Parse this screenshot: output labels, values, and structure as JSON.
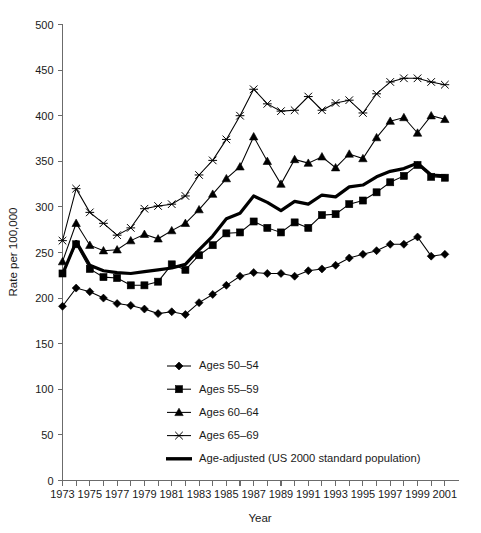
{
  "chart_data": {
    "type": "line",
    "title": "",
    "xlabel": "Year",
    "ylabel": "Rate per 100,000",
    "xlim": [
      1973,
      2002
    ],
    "ylim": [
      0,
      500
    ],
    "ytick_step": 50,
    "yticks": [
      0,
      50,
      100,
      150,
      200,
      250,
      300,
      350,
      400,
      450,
      500
    ],
    "ytick_labels": [
      "0",
      "50",
      "100",
      "150",
      "200",
      "250",
      "300",
      "350",
      "400",
      "450",
      "500"
    ],
    "x": [
      1973,
      1974,
      1975,
      1976,
      1977,
      1978,
      1979,
      1980,
      1981,
      1982,
      1983,
      1984,
      1985,
      1986,
      1987,
      1988,
      1989,
      1990,
      1991,
      1992,
      1993,
      1994,
      1995,
      1996,
      1997,
      1998,
      1999,
      2000,
      2001
    ],
    "xtick_years": [
      1973,
      1974,
      1975,
      1976,
      1977,
      1978,
      1979,
      1980,
      1981,
      1982,
      1983,
      1984,
      1985,
      1986,
      1987,
      1988,
      1989,
      1990,
      1991,
      1992,
      1993,
      1994,
      1995,
      1996,
      1997,
      1998,
      1999,
      2000,
      2001
    ],
    "xtick_labels": [
      "1973",
      "",
      "1975",
      "",
      "1977",
      "",
      "1979",
      "",
      "1981",
      "",
      "1983",
      "",
      "1985",
      "",
      "1987",
      "",
      "1989",
      "",
      "1991",
      "",
      "1993",
      "",
      "1995",
      "",
      "1997",
      "",
      "1999",
      "",
      "2001"
    ],
    "grid": false,
    "legend_position": "inside-lower-center",
    "series": [
      {
        "name": "Ages 50–54",
        "marker": "diamond",
        "values": [
          191,
          211,
          207,
          200,
          194,
          192,
          188,
          183,
          185,
          182,
          195,
          204,
          214,
          224,
          228,
          227,
          227,
          224,
          230,
          232,
          236,
          244,
          248,
          252,
          259,
          259,
          267,
          246,
          248
        ]
      },
      {
        "name": "Ages 55–59",
        "marker": "square",
        "values": [
          227,
          259,
          232,
          223,
          222,
          214,
          214,
          218,
          237,
          231,
          247,
          258,
          271,
          272,
          284,
          277,
          272,
          283,
          277,
          291,
          292,
          303,
          307,
          316,
          327,
          334,
          346,
          333,
          332
        ]
      },
      {
        "name": "Ages 60–64",
        "marker": "triangle",
        "values": [
          240,
          282,
          258,
          252,
          253,
          263,
          270,
          265,
          274,
          282,
          297,
          314,
          331,
          344,
          377,
          350,
          325,
          352,
          348,
          355,
          343,
          358,
          353,
          376,
          394,
          398,
          381,
          400,
          396
        ]
      },
      {
        "name": "Ages 65–69",
        "marker": "star",
        "values": [
          263,
          320,
          294,
          282,
          269,
          277,
          298,
          301,
          303,
          312,
          335,
          351,
          374,
          400,
          429,
          413,
          405,
          406,
          421,
          406,
          414,
          417,
          403,
          424,
          437,
          441,
          441,
          437,
          434
        ]
      },
      {
        "name": "Age-adjusted (US 2000 standard population)",
        "marker": "none",
        "bold": true,
        "values": [
          226,
          262,
          236,
          230,
          228,
          227,
          229,
          231,
          233,
          237,
          253,
          268,
          287,
          293,
          312,
          305,
          296,
          306,
          303,
          313,
          311,
          322,
          324,
          333,
          339,
          342,
          348,
          335,
          334
        ]
      }
    ]
  },
  "legend": {
    "items": [
      {
        "label": "Ages 50–54",
        "marker": "diamond-marker-icon"
      },
      {
        "label": "Ages 55–59",
        "marker": "square-marker-icon"
      },
      {
        "label": "Ages 60–64",
        "marker": "triangle-marker-icon"
      },
      {
        "label": "Ages 65–69",
        "marker": "star-marker-icon"
      },
      {
        "label": "Age-adjusted (US 2000 standard population)",
        "marker": "thick-line-marker-icon"
      }
    ]
  },
  "axes": {
    "y_title": "Rate per 100,000",
    "x_title": "Year"
  },
  "colors": {
    "ink": "#000000",
    "axis": "#6b6b6b",
    "background": "#ffffff"
  }
}
